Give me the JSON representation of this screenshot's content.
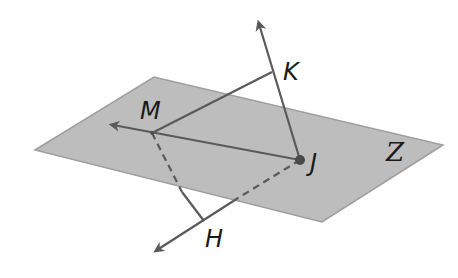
{
  "diagram": {
    "colors": {
      "background": "#ffffff",
      "plane_fill": "#bdbdbd",
      "plane_edge": "#9e9e9e",
      "line": "#5a5a5a",
      "point": "#4a4a4a",
      "text": "#1a1a1a"
    },
    "plane": {
      "label": "Z",
      "corners": [
        [
          35,
          150
        ],
        [
          154,
          77
        ],
        [
          443,
          145
        ],
        [
          322,
          222
        ]
      ]
    },
    "points": {
      "M": {
        "label": "M",
        "x": 152,
        "y": 133
      },
      "J": {
        "label": "J",
        "x": 300,
        "y": 160
      },
      "K": {
        "label": "K",
        "x": 272,
        "y": 72
      },
      "H": {
        "label": "H",
        "x": 204,
        "y": 221
      }
    },
    "segments": [
      {
        "from": "M",
        "to": "K",
        "style": "solid"
      },
      {
        "from": "M",
        "to": "H",
        "style": "partly-dashed"
      },
      {
        "from": "J",
        "to": "H",
        "style": "partly-dashed"
      }
    ],
    "rays": [
      {
        "from": "J",
        "through": "M",
        "label": "ray JM"
      },
      {
        "from": "J",
        "through": "K",
        "label": "ray JK"
      },
      {
        "from": "J",
        "through": "H",
        "label": "ray JH"
      }
    ]
  }
}
